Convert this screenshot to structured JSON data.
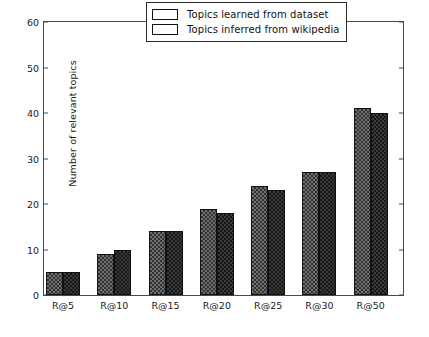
{
  "chart_data": {
    "type": "bar",
    "title": "",
    "xlabel": "",
    "ylabel": "Number of relevant topics",
    "categories": [
      "R@5",
      "R@10",
      "R@15",
      "R@20",
      "R@25",
      "R@30",
      "R@50"
    ],
    "series": [
      {
        "name": "Topics learned from dataset",
        "values": [
          5,
          9,
          14,
          19,
          24,
          27,
          41
        ],
        "color": "#6f6f6f"
      },
      {
        "name": "Topics inferred from wikipedia",
        "values": [
          5,
          10,
          14,
          18,
          23,
          27,
          40
        ],
        "color": "#3a3a3a"
      }
    ],
    "ylim": [
      0,
      60
    ],
    "yticks": [
      0,
      10,
      20,
      30,
      40,
      50,
      60
    ],
    "ytick_labels": [
      "0",
      "10",
      "20",
      "30",
      "40",
      "50",
      "60"
    ],
    "grid": false,
    "legend_position": "upper center"
  },
  "legend": {
    "entries": [
      {
        "label": "Topics learned from dataset"
      },
      {
        "label": "Topics inferred from wikipedia"
      }
    ]
  }
}
